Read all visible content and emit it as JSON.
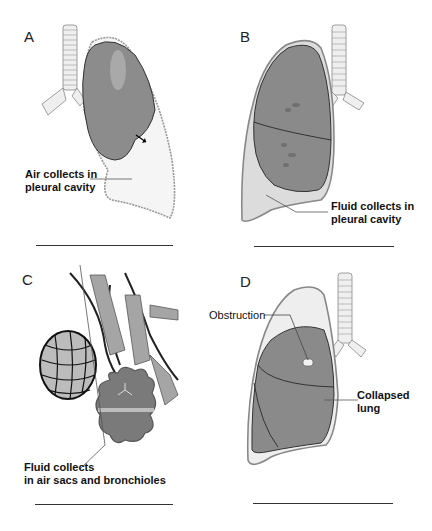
{
  "panels": [
    {
      "id": "A",
      "letter": "A",
      "labels": [
        "Air collects in",
        "pleural cavity"
      ],
      "condition": "pneumothorax"
    },
    {
      "id": "B",
      "letter": "B",
      "labels": [
        "Fluid collects in",
        "pleural cavity"
      ],
      "condition": "pleural-effusion"
    },
    {
      "id": "C",
      "letter": "C",
      "labels": [
        "Fluid collects",
        "in air sacs and bronchioles"
      ],
      "condition": "pneumonia"
    },
    {
      "id": "D",
      "letter": "D",
      "labels": [
        "Collapsed",
        "lung"
      ],
      "pointer_label": "Obstruction",
      "condition": "atelectasis"
    }
  ],
  "colors": {
    "lung_fill": "#8a8a8a",
    "lung_dark": "#6e6e6e",
    "pleura_fill": "#f2f2f2",
    "pleura_stroke": "#9a9a9a",
    "trachea": "#e8e8e8",
    "text": "#111111"
  }
}
